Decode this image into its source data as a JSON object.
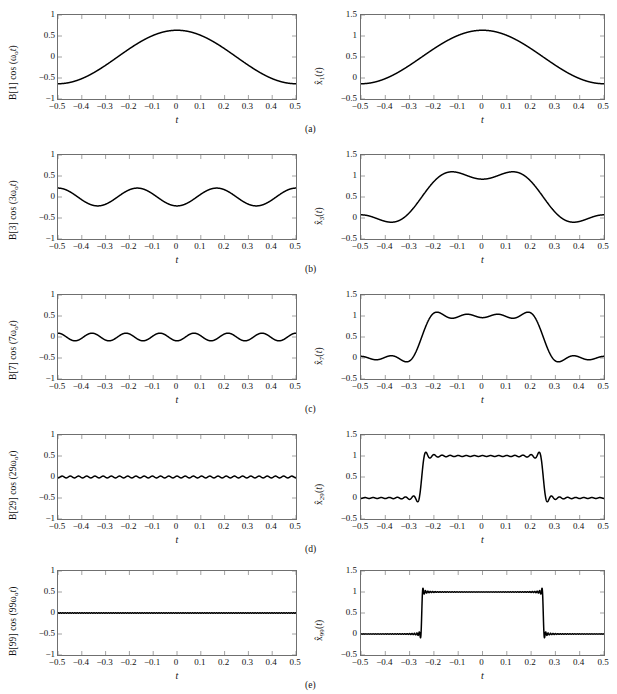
{
  "figure": {
    "caption_labels": [
      "(a)",
      "(b)",
      "(c)",
      "(d)",
      "(e)"
    ],
    "line_color": "#000000",
    "axis_color": "#6f6f6f",
    "background": "#ffffff"
  },
  "axes": {
    "xlabel": "t",
    "xticks": [
      "−0.5",
      "−0.4",
      "−0.3",
      "−0.2",
      "−0.1",
      "0",
      "0.1",
      "0.2",
      "0.3",
      "0.4",
      "0.5"
    ],
    "xtick_values": [
      -0.5,
      -0.4,
      -0.3,
      -0.2,
      -0.1,
      0,
      0.1,
      0.2,
      0.3,
      0.4,
      0.5
    ],
    "xlim": [
      -0.5,
      0.5
    ],
    "left_yticks": [
      "1",
      "0.5",
      "0",
      "−0.5",
      "−1"
    ],
    "left_ytick_values": [
      1,
      0.5,
      0,
      -0.5,
      -1
    ],
    "left_ylim": [
      -1,
      1
    ],
    "right_yticks": [
      "1.5",
      "1",
      "0.5",
      "0",
      "−0.5"
    ],
    "right_ytick_values": [
      1.5,
      1,
      0.5,
      0,
      -0.5
    ],
    "right_ylim": [
      -0.5,
      1.5
    ]
  },
  "rows": [
    {
      "id": "a",
      "caption": "(a)",
      "left": {
        "ylabel_html": "B[1] cos (&omega;<sub>o</sub><i>t</i>)",
        "harmonic": 1,
        "amplitude": 0.6366,
        "offset": 0.0
      },
      "right": {
        "ylabel_html": "x&#770;<sub>1</sub>(<i>t</i>)",
        "order": 1,
        "dc": 0.5,
        "terms": [
          1
        ]
      }
    },
    {
      "id": "b",
      "caption": "(b)",
      "left": {
        "ylabel_html": "B[3] cos (3&omega;<sub>o</sub><i>t</i>)",
        "harmonic": 3,
        "amplitude": -0.2122,
        "offset": 0.0
      },
      "right": {
        "ylabel_html": "x&#770;<sub>3</sub>(<i>t</i>)",
        "order": 3,
        "dc": 0.5,
        "terms": [
          1,
          3
        ]
      }
    },
    {
      "id": "c",
      "caption": "(c)",
      "left": {
        "ylabel_html": "B[7] cos (7&omega;<sub>o</sub><i>t</i>)",
        "harmonic": 7,
        "amplitude": -0.0909,
        "offset": 0.0
      },
      "right": {
        "ylabel_html": "x&#770;<sub>7</sub>(<i>t</i>)",
        "order": 7,
        "dc": 0.5,
        "terms": [
          1,
          3,
          5,
          7
        ]
      }
    },
    {
      "id": "d",
      "caption": "(d)",
      "left": {
        "ylabel_html": "B[29] cos (29&omega;<sub>o</sub><i>t</i>)",
        "harmonic": 29,
        "amplitude": -0.0219,
        "offset": 0.0
      },
      "right": {
        "ylabel_html": "x&#770;<sub>29</sub>(<i>t</i>)",
        "order": 29,
        "dc": 0.5,
        "terms": [
          1,
          3,
          5,
          7,
          9,
          11,
          13,
          15,
          17,
          19,
          21,
          23,
          25,
          27,
          29
        ]
      }
    },
    {
      "id": "e",
      "caption": "(e)",
      "left": {
        "ylabel_html": "B[99] cos (99&omega;<sub>o</sub><i>t</i>)",
        "harmonic": 99,
        "amplitude": -0.00643,
        "offset": 0.0
      },
      "right": {
        "ylabel_html": "x&#770;<sub>99</sub>(<i>t</i>)",
        "order": 99,
        "dc": 0.5,
        "terms": [
          1,
          3,
          5,
          7,
          9,
          11,
          13,
          15,
          17,
          19,
          21,
          23,
          25,
          27,
          29,
          31,
          33,
          35,
          37,
          39,
          41,
          43,
          45,
          47,
          49,
          51,
          53,
          55,
          57,
          59,
          61,
          63,
          65,
          67,
          69,
          71,
          73,
          75,
          77,
          79,
          81,
          83,
          85,
          87,
          89,
          91,
          93,
          95,
          97,
          99
        ]
      }
    }
  ],
  "chart_data": {
    "type": "line",
    "title": "",
    "xlabel": "t",
    "xlim": [
      -0.5,
      0.5
    ],
    "grid": false,
    "legend": "none",
    "panels": [
      {
        "row": "a",
        "side": "left",
        "ylabel": "B[1] cos (w_o t)",
        "ylim": [
          -1,
          1
        ],
        "harmonic": 1,
        "amplitude": 0.6366
      },
      {
        "row": "a",
        "side": "right",
        "ylabel": "x_hat_1(t)",
        "ylim": [
          -0.5,
          1.5
        ],
        "order": 1,
        "peak": 1.14,
        "min": -0.14
      },
      {
        "row": "b",
        "side": "left",
        "ylabel": "B[3] cos (3w_o t)",
        "ylim": [
          -1,
          1
        ],
        "harmonic": 3,
        "amplitude": 0.2122
      },
      {
        "row": "b",
        "side": "right",
        "ylabel": "x_hat_3(t)",
        "ylim": [
          -0.5,
          1.5
        ],
        "order": 3,
        "peak": 1.1,
        "min": -0.12
      },
      {
        "row": "c",
        "side": "left",
        "ylabel": "B[7] cos (7w_o t)",
        "ylim": [
          -1,
          1
        ],
        "harmonic": 7,
        "amplitude": 0.0909
      },
      {
        "row": "c",
        "side": "right",
        "ylabel": "x_hat_7(t)",
        "ylim": [
          -0.5,
          1.5
        ],
        "order": 7,
        "peak": 1.1,
        "min": -0.13
      },
      {
        "row": "d",
        "side": "left",
        "ylabel": "B[29] cos (29w_o t)",
        "ylim": [
          -1,
          1
        ],
        "harmonic": 29,
        "amplitude": 0.0219
      },
      {
        "row": "d",
        "side": "right",
        "ylabel": "x_hat_29(t)",
        "ylim": [
          -0.5,
          1.5
        ],
        "order": 29,
        "peak": 1.08,
        "min": -0.08
      },
      {
        "row": "e",
        "side": "left",
        "ylabel": "B[99] cos (99w_o t)",
        "ylim": [
          -1,
          1
        ],
        "harmonic": 99,
        "amplitude": 0.0064
      },
      {
        "row": "e",
        "side": "right",
        "ylabel": "x_hat_99(t)",
        "ylim": [
          -0.5,
          1.5
        ],
        "order": 99,
        "peak": 1.07,
        "min": -0.07
      }
    ]
  }
}
